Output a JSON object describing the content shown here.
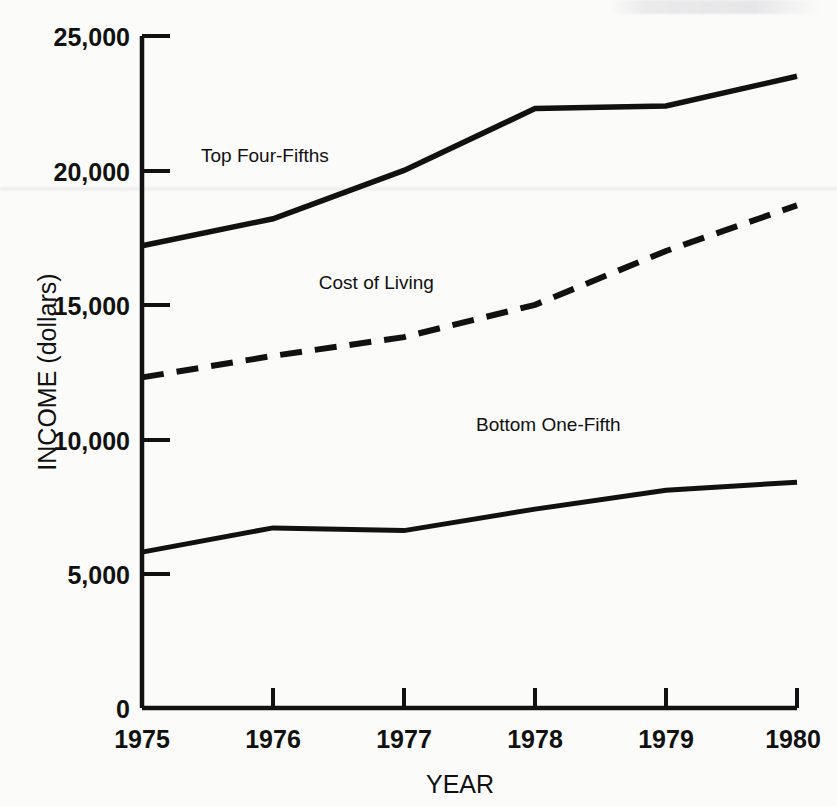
{
  "chart_data": {
    "type": "line",
    "title": "",
    "xlabel": "YEAR",
    "ylabel": "INCOME (dollars)",
    "x": [
      1975,
      1976,
      1977,
      1978,
      1979,
      1980
    ],
    "xtick_labels": [
      "1975",
      "1976",
      "1977",
      "1978",
      "1979",
      "1980"
    ],
    "ytick_labels": [
      "0",
      "5,000",
      "10,000",
      "15,000",
      "20,000",
      "25,000"
    ],
    "ytick_values": [
      0,
      5000,
      10000,
      15000,
      20000,
      25000
    ],
    "xlim": [
      1975,
      1980
    ],
    "ylim": [
      0,
      25000
    ],
    "grid": false,
    "legend_position": "inline-annotations",
    "series": [
      {
        "name": "Top Four-Fifths",
        "style": "solid",
        "color": "#111111",
        "values": [
          17200,
          18200,
          20000,
          22300,
          22400,
          23500
        ],
        "label_x": 1975.45,
        "label_y": 20300
      },
      {
        "name": "Cost of Living",
        "style": "dashed",
        "color": "#111111",
        "values": [
          12300,
          13100,
          13800,
          15000,
          17000,
          18700
        ],
        "label_x": 1976.35,
        "label_y": 15600
      },
      {
        "name": "Bottom One-Fifth",
        "style": "solid",
        "color": "#111111",
        "values": [
          5800,
          6700,
          6600,
          7400,
          8100,
          8400
        ],
        "label_x": 1977.55,
        "label_y": 10300
      }
    ]
  },
  "axis": {
    "y_title": "INCOME (dollars)",
    "x_title": "YEAR",
    "y_labels": {
      "t0": "0",
      "t5000": "5,000",
      "t10000": "10,000",
      "t15000": "15,000",
      "t20000": "20,000",
      "t25000": "25,000"
    },
    "x_labels": {
      "y1975": "1975",
      "y1976": "1976",
      "y1977": "1977",
      "y1978": "1978",
      "y1979": "1979",
      "y1980": "1980"
    }
  },
  "annotations": {
    "top": "Top Four-Fifths",
    "middle": "Cost of Living",
    "bottom": "Bottom One-Fifth"
  }
}
